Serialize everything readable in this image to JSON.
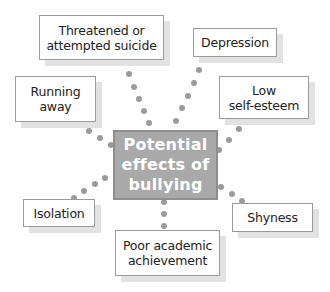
{
  "diagram": {
    "center": {
      "label": "Potential effects of bullying",
      "lines": [
        "Potential",
        "effects of",
        "bullying"
      ]
    },
    "effects": [
      {
        "id": "threatened-suicide",
        "lines": [
          "Threatened or",
          "attempted suicide"
        ]
      },
      {
        "id": "depression",
        "lines": [
          "Depression"
        ]
      },
      {
        "id": "running-away",
        "lines": [
          "Running",
          "away"
        ]
      },
      {
        "id": "low-self-esteem",
        "lines": [
          "Low",
          "self-esteem"
        ]
      },
      {
        "id": "isolation",
        "lines": [
          "Isolation"
        ]
      },
      {
        "id": "shyness",
        "lines": [
          "Shyness"
        ]
      },
      {
        "id": "poor-academic-achievement",
        "lines": [
          "Poor academic",
          "achievement"
        ]
      }
    ],
    "colors": {
      "center_fill": "#a9a9a9",
      "center_border": "#8e8e8e",
      "dot": "#9b9b9b",
      "box_border": "#9a9a9a",
      "shadow": "#e2e2e2"
    }
  }
}
